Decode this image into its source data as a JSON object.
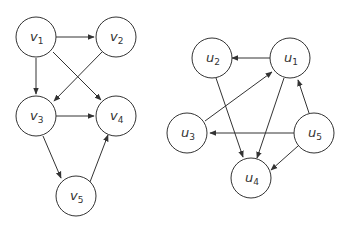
{
  "graphs": [
    {
      "name": "graph-v",
      "nodes": [
        {
          "id": "v1",
          "base": "v",
          "sub": "1"
        },
        {
          "id": "v2",
          "base": "v",
          "sub": "2"
        },
        {
          "id": "v3",
          "base": "v",
          "sub": "3"
        },
        {
          "id": "v4",
          "base": "v",
          "sub": "4"
        },
        {
          "id": "v5",
          "base": "v",
          "sub": "5"
        }
      ],
      "edges": [
        [
          "v1",
          "v2"
        ],
        [
          "v1",
          "v3"
        ],
        [
          "v1",
          "v4"
        ],
        [
          "v2",
          "v3"
        ],
        [
          "v3",
          "v4"
        ],
        [
          "v3",
          "v5"
        ],
        [
          "v5",
          "v4"
        ]
      ]
    },
    {
      "name": "graph-u",
      "nodes": [
        {
          "id": "u1",
          "base": "u",
          "sub": "1"
        },
        {
          "id": "u2",
          "base": "u",
          "sub": "2"
        },
        {
          "id": "u3",
          "base": "u",
          "sub": "3"
        },
        {
          "id": "u4",
          "base": "u",
          "sub": "4"
        },
        {
          "id": "u5",
          "base": "u",
          "sub": "5"
        }
      ],
      "edges": [
        [
          "u1",
          "u2"
        ],
        [
          "u1",
          "u4"
        ],
        [
          "u2",
          "u4"
        ],
        [
          "u3",
          "u1"
        ],
        [
          "u5",
          "u1"
        ],
        [
          "u5",
          "u3"
        ],
        [
          "u5",
          "u4"
        ]
      ]
    }
  ],
  "labels": {
    "v1": {
      "base": "v",
      "sub": "1"
    },
    "v2": {
      "base": "v",
      "sub": "2"
    },
    "v3": {
      "base": "v",
      "sub": "3"
    },
    "v4": {
      "base": "v",
      "sub": "4"
    },
    "v5": {
      "base": "v",
      "sub": "5"
    },
    "u1": {
      "base": "u",
      "sub": "1"
    },
    "u2": {
      "base": "u",
      "sub": "2"
    },
    "u3": {
      "base": "u",
      "sub": "3"
    },
    "u4": {
      "base": "u",
      "sub": "4"
    },
    "u5": {
      "base": "u",
      "sub": "5"
    }
  }
}
